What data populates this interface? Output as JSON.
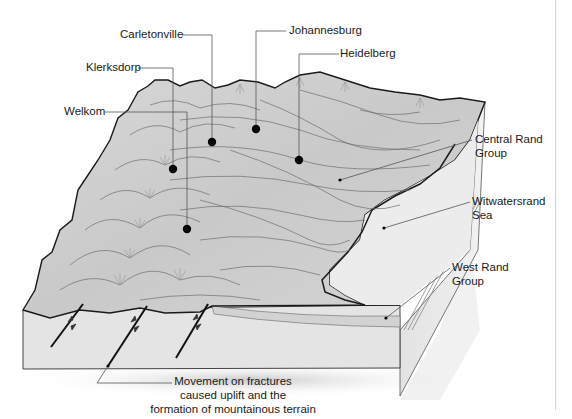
{
  "figure": {
    "colors": {
      "terrain_fill": "#cfcfcf",
      "terrain_light": "#e6e6e6",
      "sea_fill": "#ececec",
      "block_front": "#e4e4e4",
      "block_side": "#dcdcdc",
      "outline": "#1a1a1a",
      "contour": "#6e6e6e",
      "leader": "#444444",
      "marker": "#000000"
    }
  },
  "labels": {
    "carletonville": "Carletonville",
    "johannesburg": "Johannesburg",
    "heidelberg": "Heidelberg",
    "klerksdorp": "Klerksdorp",
    "welkom": "Welkom",
    "central_rand_group": "Central Rand\nGroup",
    "witwatersrand_sea": "Witwatersrand\nSea",
    "west_rand_group": "West Rand\nGroup",
    "fracture_caption": "Movement on fractures\ncaused uplift and the\nformation of mountainous terrain"
  },
  "cities": [
    {
      "name": "Carletonville",
      "x": 212,
      "y": 142
    },
    {
      "name": "Johannesburg",
      "x": 256,
      "y": 129
    },
    {
      "name": "Heidelberg",
      "x": 299,
      "y": 160
    },
    {
      "name": "Klerksdorp",
      "x": 173,
      "y": 169
    },
    {
      "name": "Welkom",
      "x": 187,
      "y": 229
    }
  ]
}
